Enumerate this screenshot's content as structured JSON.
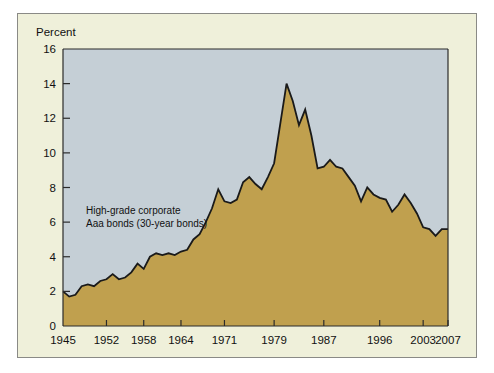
{
  "figure": {
    "background_color": "#eff0da",
    "border_color": "#8a8a86",
    "outer_background": "#ffffff"
  },
  "chart_data": {
    "type": "area",
    "title": "",
    "subtitle": "",
    "xlabel": "",
    "ylabel": "Percent",
    "ylim": [
      0,
      16
    ],
    "xlim": [
      1945,
      2007
    ],
    "grid": false,
    "legend_position": "none",
    "plot_background_color": "#c5cfd6",
    "area_fill_color": "#c0a04e",
    "line_color": "#1a1a1a",
    "y_ticks": [
      0,
      2,
      4,
      6,
      8,
      10,
      12,
      14,
      16
    ],
    "y_tick_labels": [
      "0",
      "2",
      "4",
      "6",
      "8",
      "10",
      "12",
      "14",
      "16"
    ],
    "x_ticks": [
      1945,
      1952,
      1958,
      1964,
      1971,
      1979,
      1987,
      1996,
      2003,
      2007
    ],
    "x_tick_labels": [
      "1945",
      "1952",
      "1958",
      "1964",
      "1971",
      "1979",
      "1987",
      "1996",
      "2003",
      "2007"
    ],
    "annotations": [
      {
        "name": "series-label",
        "line1": "High-grade corporate",
        "line2": "Aaa bonds (30-year bonds)",
        "x": 1950,
        "y": 6.6
      }
    ],
    "series": [
      {
        "name": "High-grade corporate Aaa bonds (30-year bonds)",
        "x": [
          1945,
          1946,
          1947,
          1948,
          1949,
          1950,
          1951,
          1952,
          1953,
          1954,
          1955,
          1956,
          1957,
          1958,
          1959,
          1960,
          1961,
          1962,
          1963,
          1964,
          1965,
          1966,
          1967,
          1968,
          1969,
          1970,
          1971,
          1972,
          1973,
          1974,
          1975,
          1976,
          1977,
          1978,
          1979,
          1980,
          1981,
          1982,
          1983,
          1984,
          1985,
          1986,
          1987,
          1988,
          1989,
          1990,
          1991,
          1992,
          1993,
          1994,
          1995,
          1996,
          1997,
          1998,
          1999,
          2000,
          2001,
          2002,
          2003,
          2004,
          2005,
          2006,
          2007
        ],
        "values": [
          2.0,
          1.7,
          1.8,
          2.3,
          2.4,
          2.3,
          2.6,
          2.7,
          3.0,
          2.7,
          2.8,
          3.1,
          3.6,
          3.3,
          4.0,
          4.2,
          4.1,
          4.2,
          4.1,
          4.3,
          4.4,
          5.0,
          5.3,
          6.0,
          6.8,
          7.9,
          7.2,
          7.1,
          7.3,
          8.3,
          8.6,
          8.2,
          7.9,
          8.6,
          9.4,
          11.7,
          14.0,
          13.0,
          11.6,
          12.5,
          11.0,
          9.1,
          9.2,
          9.6,
          9.2,
          9.1,
          8.6,
          8.1,
          7.2,
          8.0,
          7.6,
          7.4,
          7.3,
          6.6,
          7.0,
          7.6,
          7.1,
          6.5,
          5.7,
          5.6,
          5.2,
          5.6,
          5.6
        ]
      }
    ]
  }
}
